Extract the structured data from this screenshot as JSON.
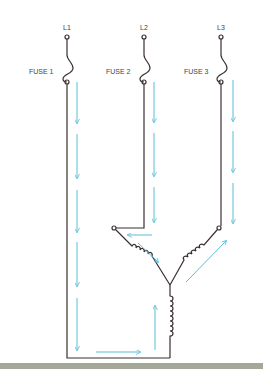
{
  "diagram": {
    "lines": [
      {
        "label": "L1",
        "fuse_label": "FUSE 1"
      },
      {
        "label": "L2",
        "fuse_label": "FUSE 2"
      },
      {
        "label": "L3",
        "fuse_label": "FUSE 3"
      }
    ],
    "colors": {
      "wire": "#3a3030",
      "current_arrow": "#5bbcd6",
      "ground_bar": "#a3a899"
    }
  }
}
